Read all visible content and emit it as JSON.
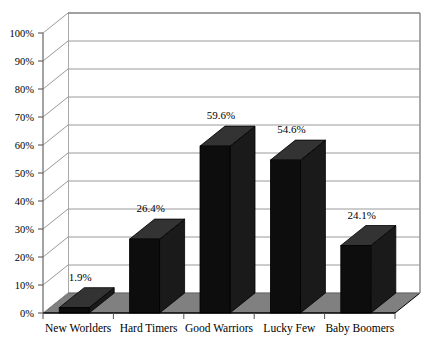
{
  "chart_data": {
    "type": "bar",
    "title": "",
    "subtitle": "",
    "xlabel": "",
    "ylabel": "",
    "categories": [
      "New Worlders",
      "Hard Timers",
      "Good Warriors",
      "Lucky Few",
      "Baby Boomers"
    ],
    "values": [
      1.9,
      26.4,
      59.6,
      54.6,
      24.1
    ],
    "data_labels": [
      "1.9%",
      "26.4%",
      "59.6%",
      "54.6%",
      "24.1%"
    ],
    "ylim": [
      0,
      100
    ],
    "ytick_values": [
      0,
      10,
      20,
      30,
      40,
      50,
      60,
      70,
      80,
      90,
      100
    ],
    "ytick_labels": [
      "0%",
      "10%",
      "20%",
      "30%",
      "40%",
      "50%",
      "60%",
      "70%",
      "80%",
      "90%",
      "100%"
    ],
    "grid": true,
    "legend": false,
    "legend_position": "none",
    "projection": "3d",
    "series": [
      {
        "name": "Percent",
        "values": [
          1.9,
          26.4,
          59.6,
          54.6,
          24.1
        ]
      }
    ]
  },
  "style": {
    "bar_front_color": "#0d0d0d",
    "bar_top_color": "#333333",
    "bar_side_color": "#1a1a1a",
    "floor_color": "#808080",
    "floor_edge_color": "#000000",
    "wall_color": "#ffffff",
    "grid_color": "#9a9a9a",
    "axis_color": "#666666",
    "frame_color": "#555555",
    "text_color": "#000000"
  }
}
